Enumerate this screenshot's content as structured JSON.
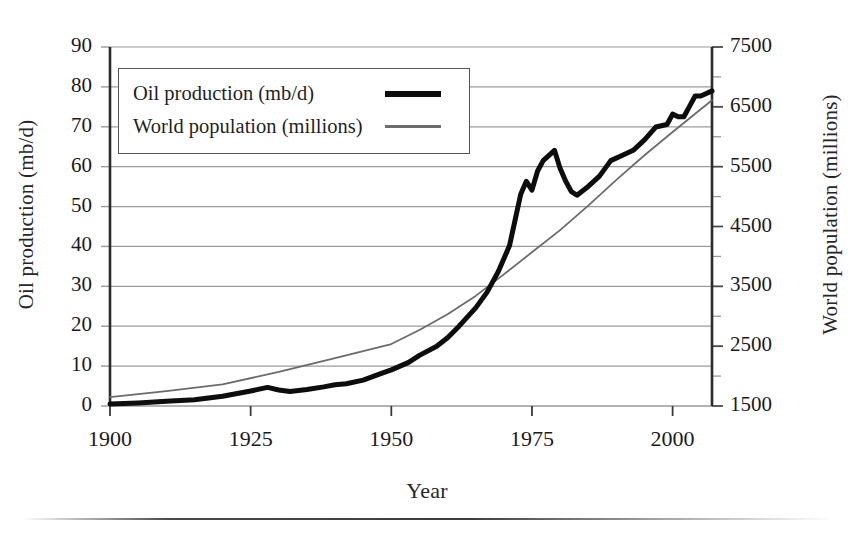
{
  "chart_data": {
    "type": "line",
    "title": "",
    "xlabel": "Year",
    "ylabel": "Oil production (mb/d)",
    "ylabel_right": "World population (millions)",
    "xlim": [
      1900,
      2007
    ],
    "ylim": [
      0,
      90
    ],
    "ylim_right": [
      1500,
      7500
    ],
    "grid": true,
    "legend_position": "upper-left",
    "xticks": [
      1900,
      1925,
      1950,
      1975,
      2000
    ],
    "xtick_labels": [
      "1900",
      "1925",
      "1950",
      "1975",
      "2000"
    ],
    "yticks_left": [
      0,
      10,
      20,
      30,
      40,
      50,
      60,
      70,
      80,
      90
    ],
    "ytick_labels_left": [
      "0",
      "10",
      "20",
      "30",
      "40",
      "50",
      "60",
      "70",
      "80",
      "90"
    ],
    "yticks_right": [
      1500,
      2500,
      3500,
      4500,
      5500,
      6500,
      7500
    ],
    "ytick_labels_right": [
      "1500",
      "2500",
      "3500",
      "4500",
      "5500",
      "6500",
      "7500"
    ],
    "colors": {
      "oil_line": "#0d0d0d",
      "population_line": "#6b6b6b",
      "gridline": "#9a9a9a",
      "axis": "#2b2b2b"
    },
    "series": [
      {
        "name": "Oil production (mb/d)",
        "axis": "left",
        "units": "mb/d",
        "color": "#0d0d0d",
        "line_width": 5,
        "x": [
          1900,
          1905,
          1910,
          1915,
          1920,
          1925,
          1928,
          1930,
          1932,
          1935,
          1938,
          1940,
          1942,
          1945,
          1948,
          1950,
          1953,
          1955,
          1958,
          1960,
          1962,
          1965,
          1967,
          1969,
          1971,
          1973,
          1974,
          1975,
          1976,
          1977,
          1979,
          1980,
          1981,
          1982,
          1983,
          1985,
          1987,
          1989,
          1991,
          1993,
          1995,
          1997,
          1999,
          2000,
          2001,
          2002,
          2003,
          2004,
          2005,
          2006,
          2007
        ],
        "y": [
          0.4,
          0.6,
          0.9,
          1.2,
          1.9,
          2.9,
          3.6,
          3.1,
          2.8,
          3.2,
          3.7,
          4.1,
          4.3,
          5.0,
          6.2,
          7.0,
          8.4,
          9.8,
          11.5,
          13.2,
          15.4,
          19.0,
          22.0,
          26.0,
          31.0,
          41.0,
          43.5,
          41.8,
          45.5,
          47.5,
          49.5,
          46.0,
          43.5,
          41.5,
          40.8,
          42.5,
          44.5,
          47.5,
          48.5,
          49.5,
          51.5,
          54.0,
          54.5,
          56.5,
          56.0,
          56.0,
          58.0,
          60.0,
          60.0,
          60.5,
          61.0
        ]
      },
      {
        "name": "World population (millions)",
        "axis": "right",
        "units": "millions",
        "color": "#6b6b6b",
        "line_width": 1.8,
        "x": [
          1900,
          1910,
          1920,
          1930,
          1940,
          1950,
          1955,
          1960,
          1965,
          1970,
          1975,
          1980,
          1985,
          1990,
          1995,
          2000,
          2005,
          2007
        ],
        "y": [
          1650,
          1750,
          1860,
          2070,
          2300,
          2536,
          2770,
          3035,
          3340,
          3700,
          4070,
          4440,
          4850,
          5280,
          5690,
          6080,
          6460,
          6610
        ]
      }
    ],
    "notes": {
      "crossover_year": 1963,
      "oil_1979_peak_left_units": 64,
      "oil_1983_trough_left_units": 56,
      "oil_end_left_units": 79,
      "population_end_left_units": 76
    }
  },
  "legend": {
    "items": [
      {
        "label": "Oil production (mb/d)",
        "style": "thick-black"
      },
      {
        "label": "World population (millions)",
        "style": "thin-gray"
      }
    ]
  }
}
